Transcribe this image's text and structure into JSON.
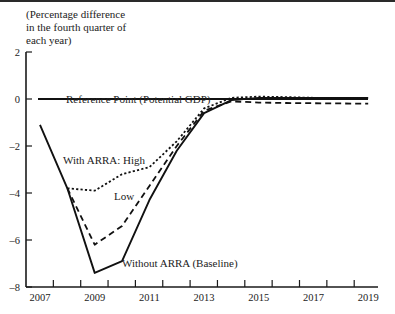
{
  "chart_data": {
    "type": "line",
    "title": "",
    "ylabel": "(Percentage difference\nin the fourth quarter of\neach year)",
    "xlabel": "",
    "x": [
      2007,
      2008,
      2009,
      2010,
      2011,
      2012,
      2013,
      2014,
      2015,
      2016,
      2017,
      2018,
      2019
    ],
    "x_tick_labels": [
      "2007",
      "2009",
      "2011",
      "2013",
      "2015",
      "2017",
      "2019"
    ],
    "y_tick_labels": [
      "2",
      "0",
      "-2",
      "-4",
      "-6",
      "-8"
    ],
    "ylim": [
      -8,
      2
    ],
    "xlim": [
      2006.5,
      2019.5
    ],
    "grid": false,
    "legend": "inline annotations",
    "series": [
      {
        "name": "Reference Point (Potential GDP)",
        "style": "solid",
        "values": [
          0,
          0,
          0,
          0,
          0,
          0,
          0,
          0,
          0,
          0,
          0,
          0,
          0
        ]
      },
      {
        "name": "Without ARRA (Baseline)",
        "style": "solid",
        "values": [
          -1.1,
          -3.8,
          -7.4,
          -6.9,
          -4.3,
          -2.2,
          -0.6,
          -0.05,
          0.05,
          0.05,
          0.05,
          0.05,
          0.05
        ]
      },
      {
        "name": "With ARRA: High",
        "style": "dotted",
        "values": [
          null,
          -3.8,
          -3.9,
          -3.2,
          -2.9,
          -1.8,
          -0.4,
          0.05,
          0.1,
          0.08,
          0.05,
          0.05,
          0.05
        ]
      },
      {
        "name": "With ARRA: Low",
        "style": "dashed",
        "values": [
          null,
          -3.8,
          -6.2,
          -5.4,
          -3.7,
          -2.0,
          -0.5,
          -0.1,
          -0.15,
          -0.17,
          -0.18,
          -0.19,
          -0.2
        ]
      }
    ],
    "annotations": {
      "reference": "Reference Point (Potential GDP)",
      "high": "With ARRA: High",
      "low": "Low",
      "baseline": "Without ARRA (Baseline)"
    }
  }
}
